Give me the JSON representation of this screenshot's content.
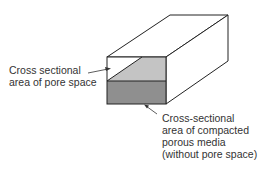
{
  "diagram": {
    "colors": {
      "stroke": "#222222",
      "pore_fill": "#c4c4c4",
      "media_fill": "#8f8f8f",
      "background": "#ffffff"
    },
    "labels": {
      "pore_space": {
        "lines": [
          "Cross sectional",
          "area of pore space"
        ]
      },
      "compacted_media": {
        "lines": [
          "Cross-sectional",
          "area of compacted",
          "porous media",
          "(without pore space)"
        ]
      }
    }
  }
}
